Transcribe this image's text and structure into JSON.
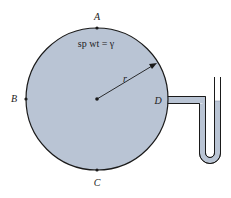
{
  "diagram": {
    "equation": "sp wt = γ",
    "radius_label": "r",
    "points": [
      {
        "id": "A",
        "label": "A",
        "position": "top"
      },
      {
        "id": "B",
        "label": "B",
        "position": "left"
      },
      {
        "id": "C",
        "label": "C",
        "position": "bottom"
      },
      {
        "id": "D",
        "label": "D",
        "position": "right"
      }
    ],
    "colors": {
      "fluid": "#b9c4d4",
      "outline": "#1a1a1a",
      "background": "#ffffff"
    }
  }
}
